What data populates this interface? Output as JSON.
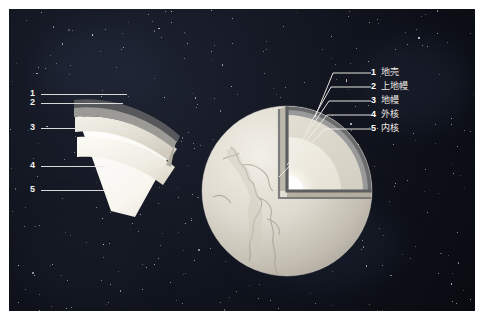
{
  "figure": {
    "background_color": "#12161f",
    "frame_color": "#ffffff"
  },
  "layers": [
    {
      "number": "1",
      "label": "地壳",
      "color": "#585a5c"
    },
    {
      "number": "2",
      "label": "上地幔",
      "color": "#8f9093"
    },
    {
      "number": "3",
      "label": "地幔",
      "color": "#dcd8cd"
    },
    {
      "number": "4",
      "label": "外核",
      "color": "#eeeae0"
    },
    {
      "number": "5",
      "label": "内核",
      "color": "#fdfdfb"
    }
  ],
  "left_diagram": {
    "name": "wedge-cutaway",
    "numbers": [
      "1",
      "2",
      "3",
      "4",
      "5"
    ]
  },
  "right_diagram": {
    "name": "globe-cutaway"
  }
}
